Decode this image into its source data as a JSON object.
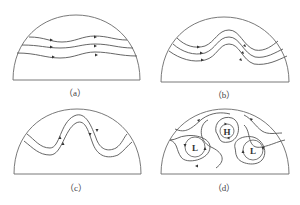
{
  "figure": {
    "panels": [
      {
        "id": "a",
        "caption": "（a）",
        "description": "Three roughly straight zonal streamlines with slight undulation, flowing west to east"
      },
      {
        "id": "b",
        "caption": "（b）",
        "description": "Three streamlines with a developing wave (ridge and trough)"
      },
      {
        "id": "c",
        "caption": "（c）",
        "description": "Two streamlines with a strongly amplified wave"
      },
      {
        "id": "d",
        "caption": "（d）",
        "description": "Wave breaks into closed cells: a high and two lows",
        "cells": [
          {
            "label": "H",
            "type": "high"
          },
          {
            "label": "L",
            "type": "low"
          },
          {
            "label": "L",
            "type": "low"
          }
        ]
      }
    ],
    "colors": {
      "line": "#6a6a6a",
      "arrow": "#333333",
      "text": "#444444"
    }
  }
}
